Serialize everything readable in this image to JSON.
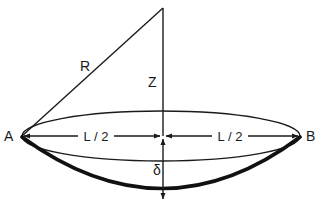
{
  "diagram": {
    "type": "geometry-figure",
    "labels": {
      "point_a": "A",
      "point_b": "B",
      "radius": "R",
      "center_offset": "Z",
      "half_chord_left": "L / 2",
      "half_chord_right": "L / 2",
      "sag": "δ"
    },
    "colors": {
      "line": "#1a1a1a",
      "background": "#ffffff"
    }
  }
}
